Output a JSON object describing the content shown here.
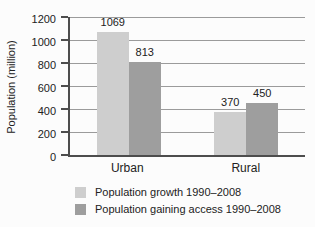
{
  "chart_data": {
    "type": "bar",
    "title": "",
    "xlabel": "",
    "ylabel": "Population (million)",
    "categories": [
      "Urban",
      "Rural"
    ],
    "series": [
      {
        "name": "Population growth 1990–2008",
        "color": "#cecece",
        "values": [
          1069,
          370
        ]
      },
      {
        "name": "Population gaining access 1990–2008",
        "color": "#9e9e9e",
        "values": [
          813,
          450
        ]
      }
    ],
    "ylim": [
      0,
      1200
    ],
    "ytick_step": 200,
    "yticks": [
      0,
      200,
      400,
      600,
      800,
      1000,
      1200
    ],
    "bar_value_labels": {
      "Urban": [
        1069,
        813
      ],
      "Rural": [
        370,
        450
      ]
    },
    "grid": true,
    "legend_position": "bottom",
    "colors": {
      "axis": "#4d4d4d",
      "gridline": "#9b9b9b",
      "text": "#222222",
      "background": "#fcfcfc"
    }
  }
}
